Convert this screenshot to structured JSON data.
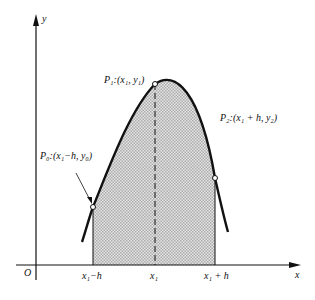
{
  "figure": {
    "axes": {
      "x_label": "x",
      "y_label": "y",
      "origin_label": "O"
    },
    "points": [
      {
        "id": "P0",
        "label": "P₀:(x₁−h, y₀)"
      },
      {
        "id": "P1",
        "label": "P₁:(x₁, y₁)"
      },
      {
        "id": "P2",
        "label": "P₂:(x₁ + h, y₂)"
      }
    ],
    "x_ticks": [
      "x₁−h",
      "x₁",
      "x₁ + h"
    ],
    "colors": {
      "stroke": "#111111",
      "fill": "#d4d4d4",
      "background": "#ffffff"
    }
  }
}
